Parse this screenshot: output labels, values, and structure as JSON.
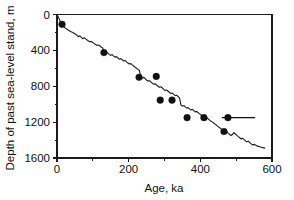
{
  "chart_data": {
    "type": "line",
    "title": "",
    "xlabel": "Age, ka",
    "ylabel": "Depth of past sea-level stand, m",
    "xlim": [
      0,
      600
    ],
    "ylim": [
      0,
      1600
    ],
    "y_inverted": true,
    "grid": false,
    "legend": "none",
    "x_ticks": [
      0,
      200,
      400,
      600
    ],
    "x_tick_labels": [
      "0",
      "200",
      "400",
      "600"
    ],
    "x_minor_ticks": [
      100,
      300,
      500
    ],
    "y_ticks": [
      0,
      400,
      800,
      1200,
      1600
    ],
    "y_tick_labels": [
      "0",
      "400",
      "800",
      "1200",
      "1600"
    ],
    "y_minor_ticks": [
      200,
      600,
      1000,
      1400
    ],
    "series": [
      {
        "name": "Modeled sea-level curve",
        "type": "line",
        "color": "#222222",
        "x": [
          0,
          5,
          10,
          14,
          20,
          26,
          32,
          38,
          44,
          50,
          56,
          60,
          64,
          68,
          72,
          76,
          80,
          84,
          88,
          92,
          96,
          100,
          104,
          108,
          112,
          116,
          120,
          124,
          128,
          131,
          134,
          138,
          142,
          146,
          150,
          154,
          158,
          162,
          166,
          170,
          174,
          178,
          182,
          186,
          190,
          194,
          198,
          202,
          206,
          210,
          214,
          218,
          222,
          226,
          230,
          234,
          238,
          242,
          246,
          250,
          254,
          258,
          262,
          266,
          270,
          274,
          278,
          282,
          286,
          290,
          294,
          298,
          302,
          306,
          310,
          314,
          318,
          322,
          326,
          330,
          334,
          338,
          342,
          346,
          350,
          354,
          358,
          362,
          366,
          370,
          374,
          378,
          382,
          386,
          390,
          394,
          398,
          402,
          406,
          410,
          414,
          418,
          422,
          426,
          430,
          434,
          438,
          442,
          446,
          450,
          454,
          458,
          462,
          466,
          470,
          474,
          478,
          482,
          486,
          490,
          494,
          498,
          502,
          506,
          510,
          514,
          518,
          522,
          526,
          530,
          534,
          538,
          542,
          546,
          550,
          556,
          562,
          568,
          574,
          580
        ],
        "y": [
          0,
          40,
          85,
          110,
          140,
          160,
          175,
          190,
          200,
          215,
          232,
          248,
          238,
          255,
          270,
          258,
          272,
          285,
          295,
          305,
          300,
          312,
          325,
          335,
          345,
          340,
          352,
          365,
          375,
          425,
          430,
          420,
          432,
          445,
          455,
          448,
          462,
          475,
          470,
          485,
          498,
          492,
          505,
          518,
          512,
          528,
          540,
          552,
          548,
          562,
          575,
          588,
          600,
          612,
          625,
          700,
          712,
          700,
          715,
          730,
          742,
          738,
          752,
          765,
          778,
          772,
          788,
          800,
          812,
          806,
          820,
          835,
          848,
          842,
          856,
          870,
          882,
          876,
          890,
          905,
          900,
          915,
          930,
          1010,
          1022,
          1015,
          1030,
          1044,
          1038,
          1052,
          1065,
          1058,
          1072,
          1086,
          1080,
          1095,
          1108,
          1120,
          1132,
          1140,
          1150,
          1152,
          1165,
          1178,
          1190,
          1200,
          1212,
          1225,
          1238,
          1250,
          1262,
          1275,
          1288,
          1300,
          1290,
          1310,
          1325,
          1338,
          1350,
          1335,
          1318,
          1332,
          1348,
          1362,
          1375,
          1388,
          1380,
          1395,
          1408,
          1420,
          1412,
          1428,
          1442,
          1455,
          1448,
          1462,
          1470,
          1478,
          1484,
          1490
        ]
      },
      {
        "name": "Dated sea-level lowstand observations",
        "type": "scatter",
        "color": "#111111",
        "marker": "filled-circle",
        "points": [
          {
            "x": 14,
            "y": 110
          },
          {
            "x": 131,
            "y": 425
          },
          {
            "x": 229,
            "y": 700
          },
          {
            "x": 277,
            "y": 690
          },
          {
            "x": 288,
            "y": 955
          },
          {
            "x": 321,
            "y": 955
          },
          {
            "x": 363,
            "y": 1150
          },
          {
            "x": 410,
            "y": 1150
          },
          {
            "x": 477,
            "y": 1150,
            "xerr_low": 460,
            "xerr_high": 553
          },
          {
            "x": 466,
            "y": 1305
          }
        ]
      }
    ]
  },
  "figure": {
    "background_color": "#ffffff",
    "axis_color": "#1a1a1a",
    "curve_color": "#222222",
    "marker_color": "#111111"
  }
}
